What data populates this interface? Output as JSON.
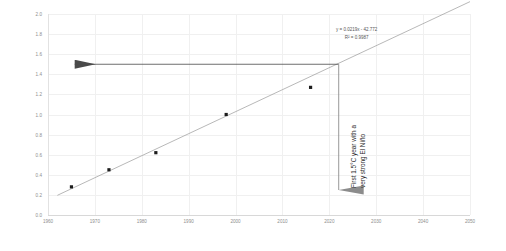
{
  "chart_data": {
    "type": "scatter",
    "title": "",
    "xlabel": "",
    "ylabel": "TEMPERATURE, °C VS. 1850-1900 BASELINE",
    "xlim": [
      1960,
      2050
    ],
    "ylim": [
      0.0,
      2.0
    ],
    "xticks": [
      1960,
      1970,
      1980,
      1990,
      2000,
      2010,
      2020,
      2030,
      2040,
      2050
    ],
    "yticks": [
      "0.0",
      "0.2",
      "0.4",
      "0.6",
      "0.8",
      "1.0",
      "1.2",
      "1.4",
      "1.6",
      "1.8",
      "2.0"
    ],
    "grid": true,
    "legend": "none",
    "series": [
      {
        "name": "Observed annual temperature anomaly",
        "marker": "square",
        "color": "#1c1c1c",
        "points": [
          {
            "x": 1965,
            "y": 0.28
          },
          {
            "x": 1973,
            "y": 0.45
          },
          {
            "x": 1983,
            "y": 0.62
          },
          {
            "x": 1998,
            "y": 1.0
          },
          {
            "x": 2016,
            "y": 1.27
          }
        ]
      }
    ],
    "trendline": {
      "type": "linear",
      "equation": "y = 0.0219x - 42.772",
      "r_squared_label": "R² = 0.9987",
      "slope": 0.0219,
      "intercept": -42.772,
      "r_squared": 0.9987,
      "color": "#9a9a9a",
      "x_start": 1962,
      "x_end": 2050
    },
    "annotations": [
      {
        "name": "threshold-line-1.5",
        "kind": "horizontal-arrow",
        "y": 1.5,
        "x_from": 2022,
        "x_to": 1961,
        "color": "#4a4a4a"
      },
      {
        "name": "crossing-year-arrow",
        "kind": "vertical-arrow",
        "x": 2022,
        "y_from": 1.5,
        "y_to": 0.0,
        "color": "#8c8c8c"
      },
      {
        "name": "crossing-year-note",
        "kind": "text",
        "line1": "First 1.5°C year with a",
        "line2": "very strong El Niño",
        "color": "#2b2b2b"
      }
    ]
  },
  "colors": {
    "grid": "#f0f0f0",
    "axis": "#dcdcdc",
    "tick_text": "#8e8e8e",
    "marker": "#1c1c1c",
    "trend": "#9a9a9a",
    "arrow_h": "#4a4a4a",
    "arrow_v": "#8c8c8c",
    "equation_text": "#555555",
    "note_text": "#2b2b2b"
  }
}
